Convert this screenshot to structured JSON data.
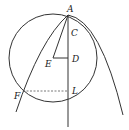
{
  "diagram": {
    "points": {
      "A": {
        "label": "A",
        "x": 68,
        "y": 15
      },
      "C": {
        "label": "C",
        "x": 68,
        "y": 30
      },
      "D": {
        "label": "D",
        "x": 68,
        "y": 58
      },
      "E": {
        "label": "E",
        "x": 53,
        "y": 58
      },
      "F": {
        "label": "F",
        "x": 23,
        "y": 91
      },
      "L": {
        "label": "L",
        "x": 68,
        "y": 91
      }
    },
    "circle": {
      "cx": 53,
      "cy": 58,
      "r": 44
    },
    "stroke_color": "#333333",
    "dash_color": "#555555"
  }
}
